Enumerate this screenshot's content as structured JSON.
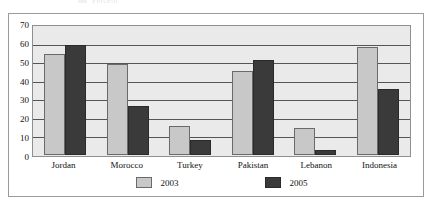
{
  "top_clipped_strip": {
    "visible": true,
    "text": "Percent"
  },
  "chart_data": {
    "type": "bar",
    "title": "",
    "xlabel": "",
    "ylabel": "",
    "ylim": [
      0,
      70
    ],
    "ytick_step": 10,
    "yticks": [
      70,
      60,
      50,
      40,
      30,
      20,
      10,
      0
    ],
    "grid": true,
    "legend_position": "bottom",
    "categories": [
      "Jordan",
      "Morocco",
      "Turkey",
      "Pakistan",
      "Lebanon",
      "Indonesia"
    ],
    "series": [
      {
        "name": "2003",
        "color": "#c8c8c8",
        "values": [
          55,
          50,
          16,
          46,
          15,
          59
        ]
      },
      {
        "name": "2005",
        "color": "#3a3a3a",
        "values": [
          60,
          27,
          8,
          52,
          3,
          36
        ]
      }
    ]
  },
  "colors": {
    "plot_background": "#eaeaea",
    "gridline": "#555555",
    "frame_border": "#9b9b9b",
    "axis_border": "#8f8f8f",
    "text": "#111111"
  }
}
